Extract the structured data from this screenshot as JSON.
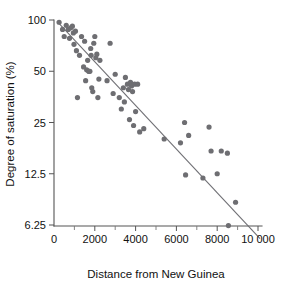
{
  "figure": {
    "background_color": "#ffffff",
    "point_color": "#6e6e72",
    "line_color": "#6f6f74",
    "axis_color": "#555555"
  },
  "chart_data": {
    "type": "scatter",
    "title": "",
    "xlabel": "Distance from New Guinea",
    "ylabel": "Degree of saturation (%)",
    "xlim": [
      0,
      10000
    ],
    "ylim": [
      5,
      100
    ],
    "yscale": "log2",
    "grid": false,
    "legend": null,
    "xticks": [
      0,
      2000,
      4000,
      6000,
      8000,
      10000
    ],
    "xtick_labels": [
      "0",
      "2000",
      "4000",
      "6000",
      "8000",
      "10 000"
    ],
    "xticks_minor": [
      1000,
      3000,
      5000,
      7000,
      9000
    ],
    "yticks": [
      100,
      50,
      25,
      12.5,
      6.25
    ],
    "ytick_labels": [
      "100",
      "50",
      "25",
      "12.5",
      "6.25"
    ],
    "trend_line": {
      "x": [
        150,
        10100
      ],
      "y": [
        98,
        5.2
      ]
    },
    "points": [
      {
        "x": 250,
        "y": 97
      },
      {
        "x": 420,
        "y": 88
      },
      {
        "x": 500,
        "y": 80
      },
      {
        "x": 600,
        "y": 93
      },
      {
        "x": 700,
        "y": 88
      },
      {
        "x": 760,
        "y": 78
      },
      {
        "x": 820,
        "y": 90
      },
      {
        "x": 900,
        "y": 92
      },
      {
        "x": 950,
        "y": 84
      },
      {
        "x": 980,
        "y": 72
      },
      {
        "x": 1050,
        "y": 86
      },
      {
        "x": 1100,
        "y": 66
      },
      {
        "x": 1150,
        "y": 35
      },
      {
        "x": 1250,
        "y": 62
      },
      {
        "x": 1350,
        "y": 80
      },
      {
        "x": 1450,
        "y": 53
      },
      {
        "x": 1500,
        "y": 75
      },
      {
        "x": 1550,
        "y": 44
      },
      {
        "x": 1600,
        "y": 51
      },
      {
        "x": 1650,
        "y": 58
      },
      {
        "x": 1700,
        "y": 50
      },
      {
        "x": 1720,
        "y": 50
      },
      {
        "x": 1760,
        "y": 50
      },
      {
        "x": 1800,
        "y": 68
      },
      {
        "x": 1820,
        "y": 62
      },
      {
        "x": 1850,
        "y": 40
      },
      {
        "x": 1900,
        "y": 38
      },
      {
        "x": 1950,
        "y": 73
      },
      {
        "x": 2000,
        "y": 80
      },
      {
        "x": 2050,
        "y": 60
      },
      {
        "x": 2100,
        "y": 63
      },
      {
        "x": 2150,
        "y": 35
      },
      {
        "x": 2200,
        "y": 45
      },
      {
        "x": 2250,
        "y": 58
      },
      {
        "x": 2600,
        "y": 44
      },
      {
        "x": 2750,
        "y": 73
      },
      {
        "x": 2900,
        "y": 37
      },
      {
        "x": 3000,
        "y": 48
      },
      {
        "x": 3200,
        "y": 35
      },
      {
        "x": 3300,
        "y": 30
      },
      {
        "x": 3400,
        "y": 40
      },
      {
        "x": 3450,
        "y": 33
      },
      {
        "x": 3500,
        "y": 46
      },
      {
        "x": 3600,
        "y": 42
      },
      {
        "x": 3650,
        "y": 39
      },
      {
        "x": 3700,
        "y": 26
      },
      {
        "x": 3750,
        "y": 43
      },
      {
        "x": 3800,
        "y": 41
      },
      {
        "x": 3850,
        "y": 38
      },
      {
        "x": 3900,
        "y": 24
      },
      {
        "x": 3950,
        "y": 42
      },
      {
        "x": 4000,
        "y": 29
      },
      {
        "x": 4100,
        "y": 42
      },
      {
        "x": 4200,
        "y": 22
      },
      {
        "x": 4400,
        "y": 23
      },
      {
        "x": 5400,
        "y": 20
      },
      {
        "x": 6200,
        "y": 19
      },
      {
        "x": 6400,
        "y": 25
      },
      {
        "x": 6450,
        "y": 12.3
      },
      {
        "x": 6600,
        "y": 21
      },
      {
        "x": 7300,
        "y": 11.8
      },
      {
        "x": 7600,
        "y": 23.5
      },
      {
        "x": 7700,
        "y": 17
      },
      {
        "x": 8000,
        "y": 12.5
      },
      {
        "x": 8200,
        "y": 17
      },
      {
        "x": 8500,
        "y": 16.5
      },
      {
        "x": 8550,
        "y": 6.2
      },
      {
        "x": 8900,
        "y": 8.5
      }
    ]
  }
}
